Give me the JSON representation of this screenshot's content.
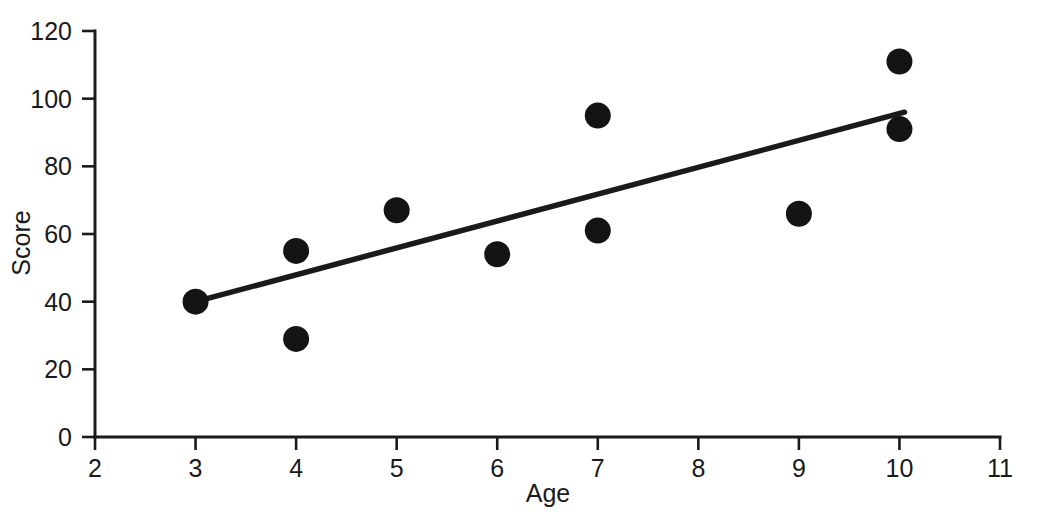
{
  "chart_data": {
    "type": "scatter",
    "title": "",
    "xlabel": "Age",
    "ylabel": "Score",
    "xlim": [
      2,
      11
    ],
    "ylim": [
      0,
      120
    ],
    "xticks": [
      2,
      3,
      4,
      5,
      6,
      7,
      8,
      9,
      10,
      11
    ],
    "xticklabels": [
      "2",
      "3",
      "4",
      "5",
      "6",
      "7",
      "8",
      "9",
      "10",
      "11"
    ],
    "yticks": [
      0,
      20,
      40,
      60,
      80,
      100,
      120
    ],
    "yticklabels": [
      "0",
      "20",
      "40",
      "60",
      "80",
      "100",
      "120"
    ],
    "grid": false,
    "legend": null,
    "marker": {
      "shape": "circle",
      "color": "#141414",
      "radius_px": 13
    },
    "points": [
      {
        "x": 3,
        "y": 40
      },
      {
        "x": 4,
        "y": 55
      },
      {
        "x": 4,
        "y": 29
      },
      {
        "x": 5,
        "y": 67
      },
      {
        "x": 6,
        "y": 54
      },
      {
        "x": 7,
        "y": 95
      },
      {
        "x": 7,
        "y": 61
      },
      {
        "x": 9,
        "y": 66
      },
      {
        "x": 10,
        "y": 111
      },
      {
        "x": 10,
        "y": 91
      }
    ],
    "series": [
      {
        "name": "Score vs Age",
        "x": [
          3,
          4,
          4,
          5,
          6,
          7,
          7,
          9,
          10,
          10
        ],
        "values": [
          40,
          55,
          29,
          67,
          54,
          95,
          61,
          66,
          111,
          91
        ]
      }
    ],
    "trend_line": {
      "type": "linear-fit",
      "color": "#1a1a1a",
      "x_start": 3,
      "y_start": 40,
      "x_end": 10.05,
      "y_end": 96
    }
  },
  "axis": {
    "x_title": "Age",
    "y_title": "Score"
  }
}
